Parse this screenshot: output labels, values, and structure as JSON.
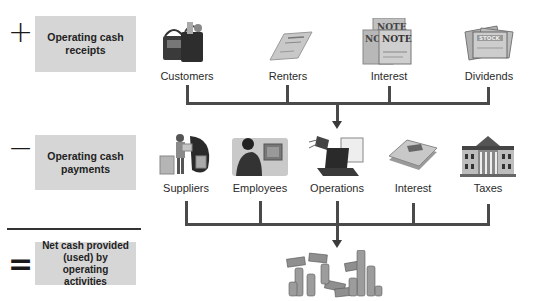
{
  "diagram": {
    "rows": [
      {
        "operator": "+",
        "label": "Operating cash receipts",
        "label_lines": [
          "Operating cash",
          "receipts"
        ],
        "sources": [
          {
            "name": "Customers",
            "icon": "shopping-bags-icon"
          },
          {
            "name": "Renters",
            "icon": "lease-document-icon"
          },
          {
            "name": "Interest",
            "icon": "note-certificates-icon"
          },
          {
            "name": "Dividends",
            "icon": "stock-certificates-icon"
          }
        ]
      },
      {
        "operator": "−",
        "label": "Operating cash payments",
        "label_lines": [
          "Operating cash",
          "payments"
        ],
        "sources": [
          {
            "name": "Suppliers",
            "icon": "supplier-boxes-icon"
          },
          {
            "name": "Employees",
            "icon": "employee-computer-icon"
          },
          {
            "name": "Operations",
            "icon": "operations-laptop-icon"
          },
          {
            "name": "Interest",
            "icon": "interest-document-icon"
          },
          {
            "name": "Taxes",
            "icon": "government-building-icon"
          }
        ]
      },
      {
        "operator": "=",
        "label": "Net cash provided (used) by operating activities",
        "label_lines": [
          "Net cash provided",
          "(used) by operating",
          "activities"
        ],
        "result_icon": "money-pile-icon"
      }
    ]
  }
}
